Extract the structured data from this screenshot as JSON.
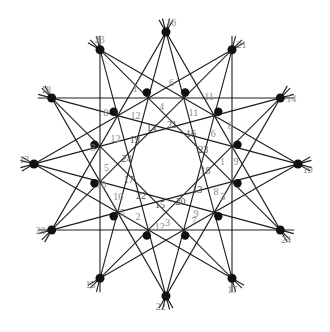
{
  "diagram": {
    "caption": "",
    "outer_nodes": [
      {
        "label": "16"
      },
      {
        "label": "21"
      },
      {
        "label": "14"
      },
      {
        "label": "19"
      },
      {
        "label": "24"
      },
      {
        "label": "17"
      },
      {
        "label": "22"
      },
      {
        "label": "15"
      },
      {
        "label": "20"
      },
      {
        "label": "13"
      },
      {
        "label": "18"
      },
      {
        "label": "23"
      }
    ],
    "inner_nodes": [
      {
        "label": "1"
      },
      {
        "label": "6"
      },
      {
        "label": "11"
      },
      {
        "label": "8"
      },
      {
        "label": "9"
      },
      {
        "label": "3"
      },
      {
        "label": "7"
      },
      {
        "label": "12"
      },
      {
        "label": "5"
      },
      {
        "label": "10"
      },
      {
        "label": "3"
      },
      {
        "label": "8"
      }
    ],
    "region_labels": [
      "4",
      "11",
      "6",
      "1",
      "8",
      "9",
      "3",
      "2",
      "10",
      "5",
      "12",
      "12",
      "5",
      "7",
      "10",
      "2",
      "9",
      "7",
      "4",
      "6",
      "11",
      "1"
    ],
    "ring_labels": [
      "14",
      "21",
      "16",
      "23",
      "18",
      "13",
      "20",
      "15",
      "22",
      "17",
      "24",
      "19"
    ],
    "connection_steps": [
      4,
      5
    ],
    "colors": {
      "line": "#1e1e1e",
      "node": "#111111",
      "label": "#8a8a8a",
      "inner_label": "#555555"
    }
  }
}
